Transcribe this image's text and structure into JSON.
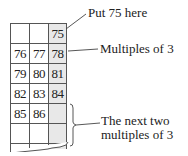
{
  "grid": {
    "rows": [
      [
        "",
        "",
        "75"
      ],
      [
        "76",
        "77",
        "78"
      ],
      [
        "79",
        "80",
        "81"
      ],
      [
        "82",
        "83",
        "84"
      ],
      [
        "85",
        "86",
        ""
      ],
      [
        "",
        "",
        ""
      ]
    ],
    "shaded_column": 2,
    "shade_color": "#e8e8e8"
  },
  "annotations": {
    "put_75": "Put 75 here",
    "multiples": "Multiples of 3",
    "next_two_line1": "The next two",
    "next_two_line2": "multiples of 3"
  }
}
